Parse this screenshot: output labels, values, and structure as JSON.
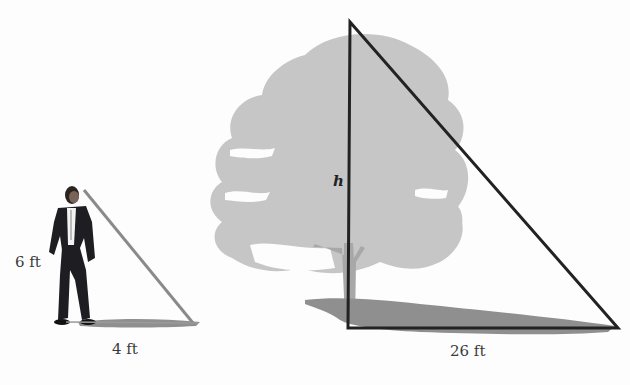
{
  "figure": {
    "person": {
      "height_label": "6 ft",
      "shadow_label": "4 ft"
    },
    "tree": {
      "height_label": "h",
      "shadow_label": "26 ft"
    },
    "colors": {
      "triangle_stroke": "#222222",
      "person_line": "#8a8a8a",
      "tree_fill": "#c6c6c6",
      "trunk_fill": "#a8a8a8",
      "shadow_fill": "#8f8f8f",
      "suit": "#1e1e22",
      "background": "#fdfdfd"
    }
  }
}
